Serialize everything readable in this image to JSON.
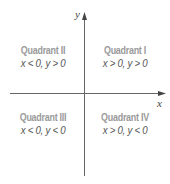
{
  "axes": {
    "x_label": "x",
    "y_label": "y",
    "color": "#555555"
  },
  "quadrants": [
    {
      "title": "Quadrant II",
      "condition": "x < 0, y > 0"
    },
    {
      "title": "Quadrant I",
      "condition": "x > 0, y > 0"
    },
    {
      "title": "Quadrant III",
      "condition": "x < 0, y < 0"
    },
    {
      "title": "Quadrant IV",
      "condition": "x > 0, y < 0"
    }
  ]
}
